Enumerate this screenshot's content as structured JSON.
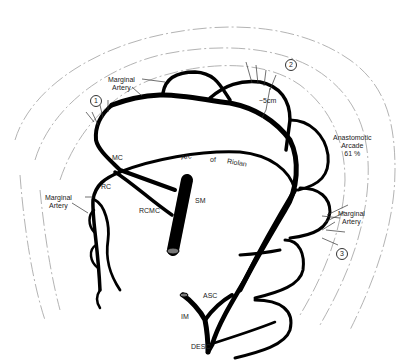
{
  "diagram": {
    "vessels": {
      "mc": "MC",
      "rc": "RC",
      "rcmc": "RCMC",
      "sm": "SM",
      "asc": "ASC",
      "im": "IM",
      "desc": "DESC"
    },
    "arc": {
      "w1": "Arc",
      "w2": "of",
      "w3": "Riolan"
    },
    "marginal_top": {
      "line1": "Marginal",
      "line2": "Artery"
    },
    "marginal_left": {
      "line1": "Marginal",
      "line2": "Artery"
    },
    "marginal_right": {
      "line1": "Marginal",
      "line2": "Artery"
    },
    "distance": "~5cm",
    "anastomotic": {
      "line1": "Anastomotic",
      "line2": "Arcade",
      "line3": "61 %"
    },
    "markers": [
      "1",
      "2",
      "3"
    ],
    "colors": {
      "vessel": "#000000",
      "outline": "#9a9a9a",
      "text": "#222222"
    }
  }
}
